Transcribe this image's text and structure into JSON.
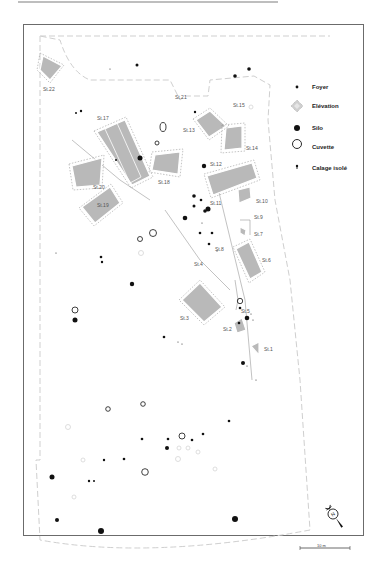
{
  "figure": {
    "title": "",
    "background": "#ffffff",
    "frame_color": "#6b6b6b",
    "structure_fill": "#b9b9b9",
    "feature_color": "#111111"
  },
  "legend": {
    "items": [
      {
        "symbol": "small-dot",
        "label": "Foyer"
      },
      {
        "symbol": "diamond-hatched",
        "label": "Elévation"
      },
      {
        "symbol": "filled-circle",
        "label": "Silo"
      },
      {
        "symbol": "open-circle",
        "label": "Cuvette"
      },
      {
        "symbol": "tiny-dot",
        "label": "Calage isolé"
      }
    ]
  },
  "structures": [
    {
      "id": "St.1",
      "label": "St.1"
    },
    {
      "id": "St.2",
      "label": "St.2"
    },
    {
      "id": "St.3",
      "label": "St.3"
    },
    {
      "id": "St.4",
      "label": "St.4"
    },
    {
      "id": "St.5",
      "label": "St.5"
    },
    {
      "id": "St.6",
      "label": "St.6"
    },
    {
      "id": "St.7",
      "label": "St.7"
    },
    {
      "id": "St.8",
      "label": "St.8"
    },
    {
      "id": "St.9",
      "label": "St.9"
    },
    {
      "id": "St.10",
      "label": "St.10"
    },
    {
      "id": "St.11",
      "label": "St.11"
    },
    {
      "id": "St.12",
      "label": "St.12"
    },
    {
      "id": "St.13",
      "label": "St.13"
    },
    {
      "id": "St.14",
      "label": "St.14"
    },
    {
      "id": "St.15",
      "label": "St.15"
    },
    {
      "id": "St.17",
      "label": "St.17"
    },
    {
      "id": "St.18",
      "label": "St.18"
    },
    {
      "id": "St.19",
      "label": "St.19"
    },
    {
      "id": "St.20",
      "label": "St.20"
    },
    {
      "id": "St.21",
      "label": "St.21"
    },
    {
      "id": "St.22",
      "label": "St.22"
    }
  ],
  "north_arrow": {
    "label": "N"
  },
  "scale_bar": {
    "label": "10 m"
  }
}
